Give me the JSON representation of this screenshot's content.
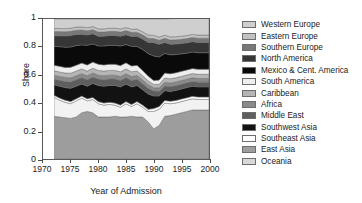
{
  "chart_data": {
    "type": "area",
    "stacked": true,
    "title": "",
    "xlabel": "Year of Admission",
    "ylabel": "Share",
    "xlim": [
      1970,
      2000
    ],
    "ylim": [
      0,
      1
    ],
    "grid": false,
    "legend_position": "right",
    "xticks": [
      1970,
      1975,
      1980,
      1985,
      1990,
      1995,
      2000
    ],
    "xtick_labels": [
      "1970",
      "1975",
      "1980",
      "1985",
      "1990",
      "1995",
      "2000"
    ],
    "yticks": [
      0,
      0.2,
      0.4,
      0.6,
      0.8,
      1
    ],
    "ytick_labels": [
      "0",
      "0.2",
      "0.4",
      "0.6",
      "0.8",
      "1"
    ],
    "x": [
      1972,
      1973,
      1974,
      1975,
      1976,
      1977,
      1978,
      1979,
      1980,
      1981,
      1982,
      1983,
      1984,
      1985,
      1986,
      1987,
      1988,
      1989,
      1990,
      1991,
      1992,
      1993,
      1994,
      1995,
      1996,
      1997,
      1998,
      1999,
      2000
    ],
    "series": [
      {
        "name": "Oceania",
        "color": "#9d9d9d",
        "values": [
          0.305,
          0.3,
          0.295,
          0.29,
          0.3,
          0.33,
          0.34,
          0.33,
          0.3,
          0.3,
          0.3,
          0.305,
          0.3,
          0.3,
          0.305,
          0.3,
          0.3,
          0.265,
          0.215,
          0.24,
          0.305,
          0.31,
          0.32,
          0.33,
          0.34,
          0.35,
          0.35,
          0.35,
          0.35
        ]
      },
      {
        "name": "East Asia",
        "color": "#f2f2f2",
        "values": [
          0.135,
          0.12,
          0.11,
          0.105,
          0.115,
          0.105,
          0.075,
          0.095,
          0.095,
          0.085,
          0.09,
          0.08,
          0.07,
          0.095,
          0.07,
          0.095,
          0.07,
          0.075,
          0.125,
          0.115,
          0.095,
          0.085,
          0.08,
          0.08,
          0.08,
          0.08,
          0.075,
          0.075,
          0.075
        ]
      },
      {
        "name": "Southeast Asia",
        "color": "#ffffff",
        "values": [
          0.015,
          0.015,
          0.015,
          0.015,
          0.015,
          0.015,
          0.015,
          0.015,
          0.015,
          0.015,
          0.015,
          0.015,
          0.015,
          0.015,
          0.015,
          0.015,
          0.015,
          0.015,
          0.02,
          0.02,
          0.018,
          0.018,
          0.018,
          0.018,
          0.018,
          0.018,
          0.018,
          0.018,
          0.018
        ]
      },
      {
        "name": "Southwest Asia",
        "color": "#121212",
        "values": [
          0.075,
          0.085,
          0.09,
          0.095,
          0.09,
          0.085,
          0.09,
          0.1,
          0.115,
          0.12,
          0.12,
          0.125,
          0.13,
          0.125,
          0.125,
          0.115,
          0.11,
          0.11,
          0.09,
          0.075,
          0.07,
          0.07,
          0.072,
          0.072,
          0.072,
          0.072,
          0.072,
          0.072,
          0.072
        ]
      },
      {
        "name": "Middle East",
        "color": "#5e5e5e",
        "values": [
          0.04,
          0.042,
          0.044,
          0.046,
          0.046,
          0.046,
          0.046,
          0.046,
          0.046,
          0.046,
          0.046,
          0.046,
          0.046,
          0.046,
          0.046,
          0.044,
          0.042,
          0.04,
          0.035,
          0.034,
          0.034,
          0.034,
          0.034,
          0.034,
          0.034,
          0.034,
          0.034,
          0.034,
          0.034
        ]
      },
      {
        "name": "Africa",
        "color": "#8a8a8a",
        "values": [
          0.028,
          0.028,
          0.028,
          0.028,
          0.028,
          0.028,
          0.028,
          0.028,
          0.028,
          0.028,
          0.028,
          0.028,
          0.028,
          0.028,
          0.028,
          0.028,
          0.028,
          0.026,
          0.024,
          0.024,
          0.026,
          0.026,
          0.026,
          0.026,
          0.026,
          0.026,
          0.026,
          0.026,
          0.026
        ]
      },
      {
        "name": "Caribbean",
        "color": "#b5b5b5",
        "values": [
          0.032,
          0.032,
          0.032,
          0.034,
          0.034,
          0.034,
          0.034,
          0.034,
          0.034,
          0.034,
          0.034,
          0.034,
          0.034,
          0.034,
          0.034,
          0.032,
          0.03,
          0.028,
          0.024,
          0.026,
          0.03,
          0.03,
          0.03,
          0.03,
          0.03,
          0.03,
          0.03,
          0.03,
          0.03
        ]
      },
      {
        "name": "South America",
        "color": "#eeeeee",
        "values": [
          0.04,
          0.04,
          0.04,
          0.042,
          0.042,
          0.042,
          0.044,
          0.044,
          0.044,
          0.044,
          0.044,
          0.044,
          0.044,
          0.044,
          0.042,
          0.04,
          0.038,
          0.034,
          0.028,
          0.03,
          0.036,
          0.036,
          0.036,
          0.036,
          0.036,
          0.036,
          0.036,
          0.036,
          0.036
        ]
      },
      {
        "name": "Mexico & Cent. America",
        "color": "#0a0a0a",
        "values": [
          0.135,
          0.14,
          0.145,
          0.145,
          0.14,
          0.13,
          0.14,
          0.13,
          0.13,
          0.135,
          0.135,
          0.135,
          0.14,
          0.13,
          0.14,
          0.135,
          0.15,
          0.16,
          0.175,
          0.165,
          0.14,
          0.135,
          0.13,
          0.125,
          0.12,
          0.118,
          0.118,
          0.118,
          0.118
        ]
      },
      {
        "name": "North America",
        "color": "#363636",
        "values": [
          0.075,
          0.078,
          0.08,
          0.082,
          0.08,
          0.076,
          0.074,
          0.072,
          0.07,
          0.07,
          0.07,
          0.07,
          0.07,
          0.07,
          0.07,
          0.072,
          0.074,
          0.08,
          0.095,
          0.09,
          0.078,
          0.076,
          0.075,
          0.074,
          0.074,
          0.074,
          0.074,
          0.074,
          0.074
        ]
      },
      {
        "name": "Southern Europe",
        "color": "#787878",
        "values": [
          0.03,
          0.03,
          0.03,
          0.03,
          0.03,
          0.03,
          0.03,
          0.03,
          0.03,
          0.03,
          0.03,
          0.03,
          0.03,
          0.03,
          0.03,
          0.03,
          0.03,
          0.03,
          0.03,
          0.03,
          0.03,
          0.03,
          0.03,
          0.03,
          0.03,
          0.03,
          0.03,
          0.03,
          0.03
        ]
      },
      {
        "name": "Eastern Europe",
        "color": "#c2c2c2",
        "values": [
          0.022,
          0.022,
          0.022,
          0.022,
          0.022,
          0.022,
          0.022,
          0.022,
          0.022,
          0.022,
          0.022,
          0.022,
          0.022,
          0.022,
          0.022,
          0.022,
          0.022,
          0.022,
          0.022,
          0.022,
          0.022,
          0.022,
          0.022,
          0.022,
          0.022,
          0.022,
          0.022,
          0.022,
          0.022
        ]
      },
      {
        "name": "Western Europe",
        "color": "#cfcfcf",
        "values": [
          0.068,
          0.068,
          0.069,
          0.066,
          0.058,
          0.057,
          0.062,
          0.054,
          0.071,
          0.071,
          0.066,
          0.068,
          0.071,
          0.061,
          0.073,
          0.072,
          0.091,
          0.115,
          0.117,
          0.129,
          0.116,
          0.13,
          0.131,
          0.143,
          0.15,
          0.152,
          0.157,
          0.157,
          0.157
        ]
      }
    ]
  },
  "legend": {
    "items": [
      {
        "label": "Western Europe",
        "color": "#cfcfcf"
      },
      {
        "label": "Eastern Europe",
        "color": "#c2c2c2"
      },
      {
        "label": "Southern Europe",
        "color": "#787878"
      },
      {
        "label": "North America",
        "color": "#363636"
      },
      {
        "label": "Mexico & Cent. America",
        "color": "#0a0a0a"
      },
      {
        "label": "South America",
        "color": "#eeeeee"
      },
      {
        "label": "Caribbean",
        "color": "#b5b5b5"
      },
      {
        "label": "Africa",
        "color": "#8a8a8a"
      },
      {
        "label": "Middle East",
        "color": "#5e5e5e"
      },
      {
        "label": "Southwest Asia",
        "color": "#121212"
      },
      {
        "label": "Southeast Asia",
        "color": "#ffffff"
      },
      {
        "label": "East Asia",
        "color": "#9d9d9d"
      },
      {
        "label": "Oceania",
        "color": "#d8d8d8"
      }
    ]
  }
}
